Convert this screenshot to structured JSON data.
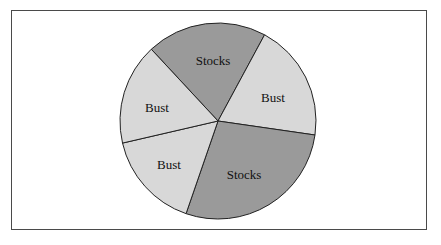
{
  "chart_data": {
    "type": "pie",
    "title": "",
    "center": [
      218,
      121
    ],
    "radius": 98,
    "labels": [
      "Stocks",
      "Bust",
      "Stocks",
      "Bust",
      "Bust"
    ],
    "values": [
      19.8,
      19.4,
      28.0,
      16.1,
      16.7
    ],
    "units": "percent (estimated from slice angles)",
    "start_angle_deg": 227.1,
    "direction": "clockwise",
    "slice_colors": [
      "#9a9a9a",
      "#d8d8d8",
      "#9a9a9a",
      "#d8d8d8",
      "#d8d8d8"
    ],
    "slices": [
      {
        "label": "Stocks",
        "position": "top",
        "percent": 19.8,
        "color": "#9a9a9a"
      },
      {
        "label": "Bust",
        "position": "right",
        "percent": 19.4,
        "color": "#d8d8d8"
      },
      {
        "label": "Stocks",
        "position": "bottom-right",
        "percent": 28.0,
        "color": "#9a9a9a"
      },
      {
        "label": "Bust",
        "position": "lower-left",
        "percent": 16.1,
        "color": "#d8d8d8"
      },
      {
        "label": "Bust",
        "position": "upper-left",
        "percent": 16.7,
        "color": "#d8d8d8"
      }
    ],
    "legend": "none",
    "grid": false
  },
  "labels": {
    "slice0": "Stocks",
    "slice1": "Bust",
    "slice2": "Stocks",
    "slice3": "Bust",
    "slice4": "Bust"
  },
  "colors": {
    "dark": "#9a9a9a",
    "light": "#d8d8d8",
    "outline": "#222222",
    "frame": "#4a4a4a"
  }
}
